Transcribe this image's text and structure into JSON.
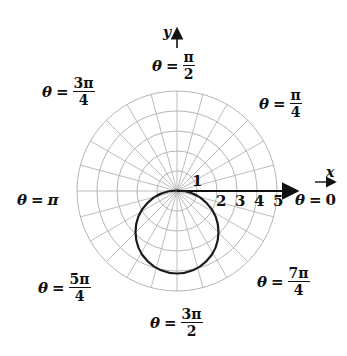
{
  "figure": {
    "type": "polar-graph",
    "curve_equation": "r = -4 sin θ",
    "curve_color": "#1a1a1a",
    "grid_color": "#b5b5b5",
    "axis_color": "#111111",
    "origin_px": [
      177,
      191
    ],
    "unit_px": 20,
    "ring_count": 5,
    "radial_line_step_deg": 15
  },
  "axes": {
    "x_label": "x",
    "y_label": "y"
  },
  "ticks": [
    "1",
    "2",
    "3",
    "4",
    "5"
  ],
  "angle_labels": {
    "a0": {
      "theta": "θ",
      "eq": "=",
      "value": "0"
    },
    "a45": {
      "theta": "θ",
      "eq": "=",
      "num": "π",
      "den": "4"
    },
    "a90": {
      "theta": "θ",
      "eq": "=",
      "num": "π",
      "den": "2"
    },
    "a135": {
      "theta": "θ",
      "eq": "=",
      "num": "3π",
      "den": "4"
    },
    "a180": {
      "theta": "θ",
      "eq": "=",
      "value": "π"
    },
    "a225": {
      "theta": "θ",
      "eq": "=",
      "num": "5π",
      "den": "4"
    },
    "a270": {
      "theta": "θ",
      "eq": "=",
      "num": "3π",
      "den": "2"
    },
    "a315": {
      "theta": "θ",
      "eq": "=",
      "num": "7π",
      "den": "4"
    }
  }
}
